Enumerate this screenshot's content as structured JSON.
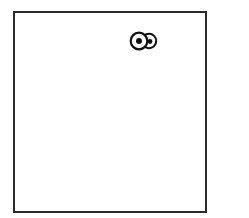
{
  "canvas": {
    "background": "#ffffff",
    "frame_color": "#2a2a2a"
  },
  "figure": {
    "icon": "googly-eyes-icon",
    "eye_count": 2,
    "stroke_color": "#111111",
    "pupil_color": "#111111"
  }
}
